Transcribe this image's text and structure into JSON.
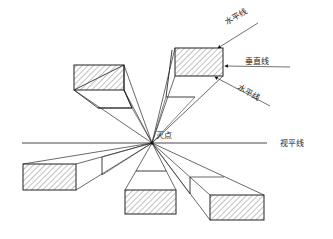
{
  "diagram": {
    "labels": {
      "vanishing_point": "灭点",
      "horizon_line": "视平线",
      "top_horizontal_line": "水平线",
      "vertical_line": "垂直线",
      "bottom_horizontal_line": "水平线"
    },
    "vanishing_point": {
      "x": 152,
      "y": 143
    },
    "horizon": {
      "x1": 22,
      "x2": 267,
      "y": 143
    },
    "colors": {
      "ink": "#2a2a2a",
      "hatch": "#555555",
      "background": "#ffffff"
    },
    "boxes": [
      {
        "name": "upper-left-box",
        "front": {
          "x": 74,
          "y": 65,
          "w": 50,
          "h": 25
        }
      },
      {
        "name": "upper-right-box",
        "front": {
          "x": 175,
          "y": 48,
          "w": 48,
          "h": 28
        }
      },
      {
        "name": "lower-left-box",
        "front": {
          "x": 23,
          "y": 164,
          "w": 53,
          "h": 26
        }
      },
      {
        "name": "lower-middle-box",
        "front": {
          "x": 125,
          "y": 190,
          "w": 51,
          "h": 24
        }
      },
      {
        "name": "lower-right-box",
        "front": {
          "x": 210,
          "y": 195,
          "w": 54,
          "h": 25
        }
      }
    ]
  }
}
